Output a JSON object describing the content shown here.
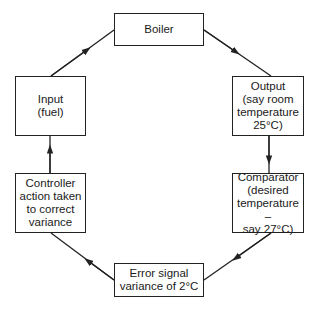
{
  "diagram": {
    "type": "control-loop",
    "nodes": [
      {
        "id": "boiler",
        "label": "Boiler"
      },
      {
        "id": "output",
        "label": "Output\n(say room\ntemperature\n25°C)"
      },
      {
        "id": "comparator",
        "label": "Comparator\n(desired\ntemperature –\nsay 27°C)"
      },
      {
        "id": "error",
        "label": "Error signal\nvariance of 2°C"
      },
      {
        "id": "controller",
        "label": "Controller\naction taken\nto correct\nvariance"
      },
      {
        "id": "input",
        "label": "Input\n(fuel)"
      }
    ],
    "edges": [
      {
        "from": "input",
        "to": "boiler"
      },
      {
        "from": "boiler",
        "to": "output"
      },
      {
        "from": "output",
        "to": "comparator"
      },
      {
        "from": "comparator",
        "to": "error"
      },
      {
        "from": "error",
        "to": "controller"
      },
      {
        "from": "controller",
        "to": "input"
      }
    ],
    "colors": {
      "stroke": "#222222",
      "background": "#ffffff"
    }
  }
}
